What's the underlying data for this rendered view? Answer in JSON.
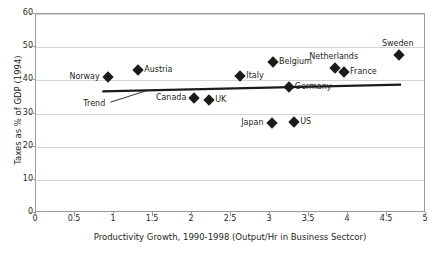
{
  "chart_data": {
    "type": "scatter",
    "title": "",
    "xlabel": "Productivity Growth, 1990-1998 (Output/Hr in Business Sectcor)",
    "ylabel": "Taxes as % of GDP (1994)",
    "xlim": [
      0,
      5
    ],
    "ylim": [
      0,
      60
    ],
    "xticks": [
      "0",
      "0.5",
      "1",
      "1.5",
      "2",
      "2.5",
      "3",
      "3.5",
      "4",
      "4.5",
      "5"
    ],
    "xtick_values": [
      0,
      0.5,
      1,
      1.5,
      2,
      2.5,
      3,
      3.5,
      4,
      4.5,
      5
    ],
    "yticks": [
      "0",
      "10",
      "20",
      "30",
      "40",
      "50",
      "60"
    ],
    "ytick_values": [
      0,
      10,
      20,
      30,
      40,
      50,
      60
    ],
    "grid": "horizontal",
    "legend": "none",
    "marker": "diamond",
    "marker_color": "#1b1b1b",
    "points": [
      {
        "name": "Norway",
        "x": 0.92,
        "y": 41.0,
        "label_pos": "left"
      },
      {
        "name": "Austria",
        "x": 1.31,
        "y": 43.0,
        "label_pos": "right"
      },
      {
        "name": "Canada",
        "x": 2.03,
        "y": 34.8,
        "label_pos": "left"
      },
      {
        "name": "UK",
        "x": 2.22,
        "y": 34.0,
        "label_pos": "right"
      },
      {
        "name": "Italy",
        "x": 2.62,
        "y": 41.3,
        "label_pos": "right"
      },
      {
        "name": "Belgium",
        "x": 3.04,
        "y": 45.5,
        "label_pos": "right"
      },
      {
        "name": "Germany",
        "x": 3.24,
        "y": 38.0,
        "label_pos": "right"
      },
      {
        "name": "Japan",
        "x": 3.02,
        "y": 27.0,
        "label_pos": "left"
      },
      {
        "name": "US",
        "x": 3.31,
        "y": 27.5,
        "label_pos": "right"
      },
      {
        "name": "Netherlands",
        "x": 3.83,
        "y": 43.6,
        "label_pos": "above"
      },
      {
        "name": "France",
        "x": 3.95,
        "y": 42.5,
        "label_pos": "right"
      },
      {
        "name": "Sweden",
        "x": 4.65,
        "y": 47.5,
        "label_pos": "above"
      }
    ],
    "trend": {
      "label": "Trend",
      "x0": 0.85,
      "y0": 36.7,
      "x1": 4.68,
      "y1": 38.7,
      "label_x": 0.62,
      "label_y": 32.8,
      "leader_to_x": 1.42,
      "leader_to_y": 36.9
    },
    "colors": {
      "marker": "#1b1b1b",
      "trend": "#1b1b1b",
      "grid": "#d4d4d4",
      "frame": "#9a9a9a",
      "text": "#231f20",
      "background": "#ffffff"
    }
  }
}
